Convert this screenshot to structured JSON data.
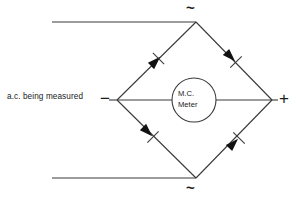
{
  "diagram": {
    "stroke_color": "#3a3a3a",
    "fill_color": "#111111",
    "background": "#ffffff",
    "labels": {
      "source": "a.c. being measured",
      "negative_terminal": "−",
      "positive_terminal": "+",
      "ac_top": "~",
      "ac_bottom": "~",
      "meter_line1": "M.C.",
      "meter_line2": "Meter"
    },
    "nodes": {
      "top": {
        "x": 196,
        "y": 22
      },
      "left": {
        "x": 117,
        "y": 100
      },
      "right": {
        "x": 272,
        "y": 100
      },
      "bottom": {
        "x": 196,
        "y": 178
      }
    },
    "meter": {
      "cx": 194,
      "cy": 100,
      "r": 22
    },
    "leads": {
      "top_line": {
        "x1": 52,
        "y1": 22,
        "x2": 196,
        "y2": 22
      },
      "bottom_line": {
        "x1": 52,
        "y1": 178,
        "x2": 196,
        "y2": 178
      },
      "left_lead": {
        "x1": 110,
        "y1": 100,
        "x2": 117,
        "y2": 100
      },
      "right_lead": {
        "x1": 272,
        "y1": 100,
        "x2": 278,
        "y2": 100
      },
      "meter_left_lead": {
        "x1": 117,
        "y1": 100,
        "x2": 172,
        "y2": 100
      },
      "meter_right_lead": {
        "x1": 216,
        "y1": 100,
        "x2": 272,
        "y2": 100
      }
    },
    "diodes": [
      {
        "name": "diode-top-left",
        "from": "left",
        "to": "top",
        "direction": "up-right",
        "conducts_toward": "top"
      },
      {
        "name": "diode-top-right",
        "from": "top",
        "to": "right",
        "direction": "down-right",
        "conducts_toward": "right"
      },
      {
        "name": "diode-bottom-left",
        "from": "left",
        "to": "bottom",
        "direction": "down-right",
        "conducts_toward": "bottom"
      },
      {
        "name": "diode-bottom-right",
        "from": "bottom",
        "to": "right",
        "direction": "up-right",
        "conducts_toward": "right"
      }
    ]
  }
}
